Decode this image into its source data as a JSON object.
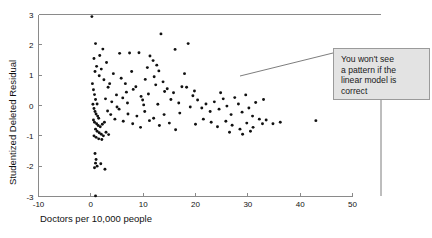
{
  "chart_data": {
    "type": "scatter",
    "title": "",
    "xlabel": "Doctors per 10,000 people",
    "ylabel": "Studentized Deleted Residual",
    "xlim": [
      -10,
      50
    ],
    "ylim": [
      -3,
      3
    ],
    "xticks": [
      -10,
      0,
      10,
      20,
      30,
      40,
      50
    ],
    "xtick_labels": [
      "-10",
      "0",
      "10",
      "20",
      "30",
      "40",
      "50"
    ],
    "yticks": [
      -3,
      -2,
      -1,
      0,
      1,
      2,
      3
    ],
    "ytick_labels": [
      "-3",
      "-2",
      "-1",
      "0",
      "1",
      "2",
      "3"
    ],
    "grid": false,
    "legend": "none",
    "marker_color": "#111111",
    "axis_color": "#8a8a8a",
    "points": [
      [
        0.2,
        2.93
      ],
      [
        0.9,
        2.04
      ],
      [
        2.3,
        1.86
      ],
      [
        5.5,
        1.72
      ],
      [
        7.4,
        1.73
      ],
      [
        9.2,
        1.74
      ],
      [
        11.3,
        1.63
      ],
      [
        13.4,
        2.36
      ],
      [
        11.9,
        1.48
      ],
      [
        12.6,
        1.33
      ],
      [
        16.1,
        1.85
      ],
      [
        18.6,
        2.04
      ],
      [
        0.6,
        1.55
      ],
      [
        1.1,
        1.29
      ],
      [
        0.8,
        1.12
      ],
      [
        1.6,
        0.98
      ],
      [
        2.0,
        1.2
      ],
      [
        4.3,
        1.05
      ],
      [
        6.6,
        0.72
      ],
      [
        8.1,
        0.53
      ],
      [
        10.4,
        0.86
      ],
      [
        12.1,
        0.95
      ],
      [
        13.0,
        1.14
      ],
      [
        17.9,
        1.05
      ],
      [
        18.3,
        0.6
      ],
      [
        3.3,
        0.6
      ],
      [
        4.9,
        0.35
      ],
      [
        6.1,
        0.25
      ],
      [
        7.0,
        0.08
      ],
      [
        9.6,
        0.3
      ],
      [
        10.1,
        0.02
      ],
      [
        11.0,
        0.38
      ],
      [
        14.1,
        0.46
      ],
      [
        15.3,
        0.2
      ],
      [
        19.5,
        0.32
      ],
      [
        0.3,
        0.72
      ],
      [
        0.5,
        0.52
      ],
      [
        0.7,
        0.36
      ],
      [
        0.9,
        0.2
      ],
      [
        1.2,
        0.05
      ],
      [
        0.4,
        0.04
      ],
      [
        0.6,
        -0.1
      ],
      [
        0.8,
        -0.2
      ],
      [
        1.0,
        -0.28
      ],
      [
        1.3,
        -0.35
      ],
      [
        1.5,
        -0.42
      ],
      [
        0.5,
        -0.48
      ],
      [
        0.7,
        -0.55
      ],
      [
        1.1,
        -0.6
      ],
      [
        1.4,
        -0.66
      ],
      [
        1.8,
        -0.7
      ],
      [
        2.2,
        -0.62
      ],
      [
        2.6,
        -0.55
      ],
      [
        0.9,
        -0.78
      ],
      [
        1.2,
        -0.85
      ],
      [
        1.6,
        -0.9
      ],
      [
        2.0,
        -0.95
      ],
      [
        2.4,
        -1.0
      ],
      [
        2.9,
        -0.88
      ],
      [
        3.4,
        -0.96
      ],
      [
        0.6,
        -1.0
      ],
      [
        1.0,
        -1.05
      ],
      [
        1.5,
        -1.1
      ],
      [
        2.1,
        -1.12
      ],
      [
        0.8,
        -1.58
      ],
      [
        1.0,
        -1.78
      ],
      [
        0.9,
        -1.9
      ],
      [
        1.2,
        -2.0
      ],
      [
        0.7,
        -2.05
      ],
      [
        1.9,
        -1.92
      ],
      [
        2.7,
        -2.1
      ],
      [
        0.9,
        -2.98
      ],
      [
        3.8,
        -0.3
      ],
      [
        4.6,
        -0.45
      ],
      [
        5.4,
        -0.12
      ],
      [
        6.2,
        -0.52
      ],
      [
        7.1,
        -0.28
      ],
      [
        8.0,
        -0.6
      ],
      [
        8.8,
        -0.35
      ],
      [
        9.5,
        -0.72
      ],
      [
        10.3,
        -0.2
      ],
      [
        11.2,
        -0.5
      ],
      [
        12.0,
        -0.42
      ],
      [
        13.1,
        -0.66
      ],
      [
        14.0,
        -0.3
      ],
      [
        15.0,
        -0.58
      ],
      [
        16.2,
        -0.8
      ],
      [
        17.0,
        -0.25
      ],
      [
        4.0,
        0.12
      ],
      [
        5.0,
        -0.05
      ],
      [
        6.8,
        0.44
      ],
      [
        8.6,
        0.62
      ],
      [
        9.9,
        0.18
      ],
      [
        12.8,
        0.04
      ],
      [
        14.6,
        0.55
      ],
      [
        16.8,
        0.08
      ],
      [
        19.0,
        -0.05
      ],
      [
        20.4,
        0.18
      ],
      [
        21.2,
        -0.08
      ],
      [
        22.0,
        0.05
      ],
      [
        22.8,
        -0.2
      ],
      [
        23.6,
        0.12
      ],
      [
        24.5,
        -0.12
      ],
      [
        25.3,
        0.22
      ],
      [
        26.0,
        -0.02
      ],
      [
        26.8,
        -0.3
      ],
      [
        27.5,
        0.26
      ],
      [
        28.2,
        0.05
      ],
      [
        28.9,
        -0.22
      ],
      [
        29.6,
        0.35
      ],
      [
        30.2,
        -0.08
      ],
      [
        30.9,
        -0.35
      ],
      [
        31.5,
        0.1
      ],
      [
        32.2,
        -0.45
      ],
      [
        20.0,
        -0.62
      ],
      [
        21.5,
        -0.45
      ],
      [
        23.0,
        -0.55
      ],
      [
        24.2,
        -0.7
      ],
      [
        25.8,
        -0.52
      ],
      [
        27.0,
        -0.65
      ],
      [
        28.5,
        -0.78
      ],
      [
        29.8,
        -0.58
      ],
      [
        31.0,
        -0.72
      ],
      [
        32.8,
        -0.6
      ],
      [
        26.5,
        -0.88
      ],
      [
        29.0,
        -0.95
      ],
      [
        30.5,
        -0.85
      ],
      [
        33.5,
        -0.48
      ],
      [
        34.8,
        -0.6
      ],
      [
        36.2,
        -0.55
      ],
      [
        43.0,
        -0.5
      ],
      [
        19.8,
        0.48
      ],
      [
        24.8,
        0.42
      ],
      [
        33.0,
        0.2
      ],
      [
        2.5,
        0.85
      ],
      [
        3.0,
        1.42
      ],
      [
        3.6,
        0.72
      ],
      [
        1.7,
        1.65
      ],
      [
        2.8,
        0.22
      ],
      [
        3.2,
        -0.18
      ],
      [
        5.8,
        0.9
      ],
      [
        13.8,
        0.78
      ],
      [
        15.8,
        0.42
      ],
      [
        17.4,
        0.62
      ],
      [
        7.8,
        1.12
      ],
      [
        10.8,
        1.25
      ],
      [
        12.4,
        0.68
      ]
    ]
  },
  "annotation": {
    "text": "You won't see\na pattern if the\nlinear model is\ncorrect",
    "background": "#e3e3e3",
    "border": "#9a9a9a"
  }
}
